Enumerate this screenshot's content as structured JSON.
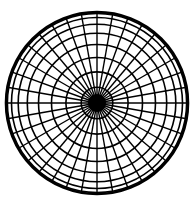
{
  "diagram": {
    "type": "polar-grid",
    "center": {
      "x": 97,
      "y": 103
    },
    "outer_radius": 91,
    "spoke_count": 36,
    "spoke_step_degrees": 10,
    "ring_latitudes_degrees": [
      10,
      20,
      30,
      40,
      50,
      60,
      70,
      80
    ],
    "hub_radius": 9,
    "colors": {
      "background": "#ffffff",
      "lines": "#000000"
    },
    "stroke": {
      "outer": 2.6,
      "ring": 1.6,
      "spoke": 1.4
    }
  }
}
